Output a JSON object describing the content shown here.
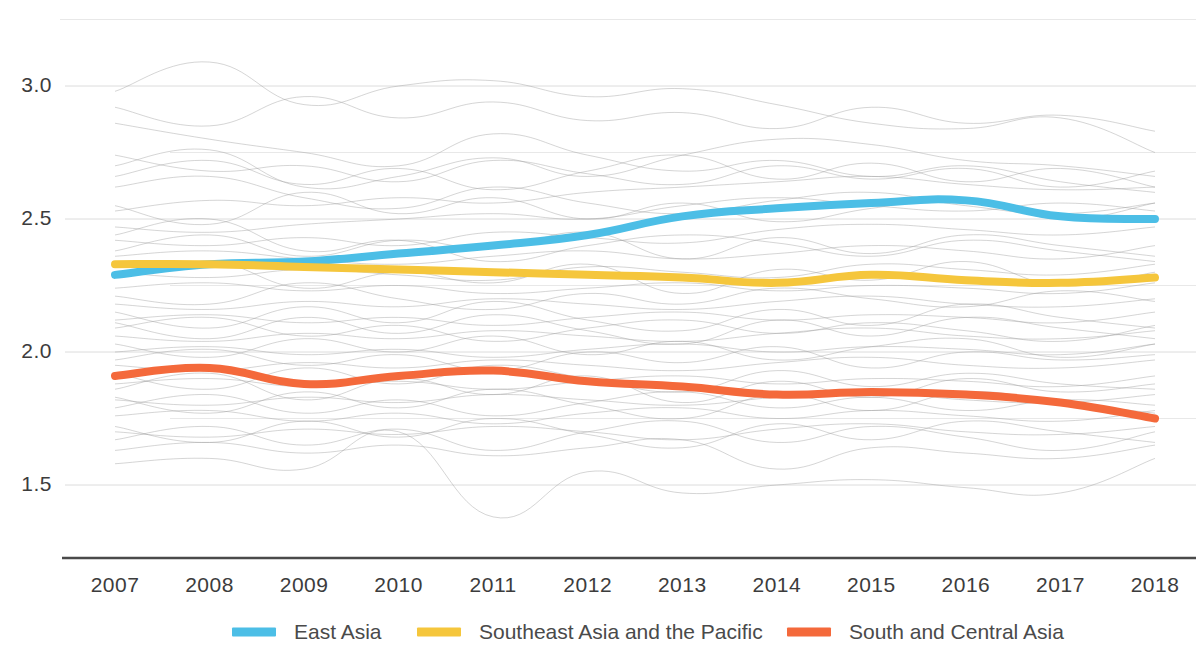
{
  "chart_data": {
    "type": "line",
    "title": "",
    "subtitle": "",
    "xlabel": "",
    "ylabel": "",
    "x": [
      2007,
      2008,
      2009,
      2010,
      2011,
      2012,
      2013,
      2014,
      2015,
      2016,
      2017,
      2018
    ],
    "categories": [
      "2007",
      "2008",
      "2009",
      "2010",
      "2011",
      "2012",
      "2013",
      "2014",
      "2015",
      "2016",
      "2017",
      "2018"
    ],
    "xlim": [
      2007,
      2018
    ],
    "ylim": [
      1.36,
      3.12
    ],
    "yticks": [
      1.5,
      2.0,
      2.5,
      3.0
    ],
    "ytick_labels": [
      "1.5",
      "2.0",
      "2.5",
      "3.0"
    ],
    "yticks_minor": [
      1.75,
      2.25,
      2.75
    ],
    "grid": true,
    "grid_axis": "y",
    "legend_position": "bottom",
    "series": [
      {
        "name": "East Asia",
        "color": "#4CBEE6",
        "highlight": true,
        "values": [
          2.29,
          2.33,
          2.34,
          2.37,
          2.4,
          2.44,
          2.51,
          2.54,
          2.56,
          2.57,
          2.51,
          2.5
        ]
      },
      {
        "name": "Southeast Asia and the Pacific",
        "color": "#F5C63C",
        "highlight": true,
        "values": [
          2.33,
          2.33,
          2.32,
          2.31,
          2.3,
          2.29,
          2.28,
          2.26,
          2.29,
          2.27,
          2.26,
          2.28
        ]
      },
      {
        "name": "South and Central Asia",
        "color": "#F4693B",
        "highlight": true,
        "values": [
          1.91,
          1.94,
          1.88,
          1.91,
          1.93,
          1.89,
          1.87,
          1.84,
          1.85,
          1.84,
          1.81,
          1.75
        ]
      }
    ],
    "background_series_note": "Numerous faint grey country lines shown behind the three highlighted regional averages",
    "background_series": [
      {
        "values": [
          2.98,
          3.09,
          2.93,
          3.0,
          3.02,
          2.96,
          2.99,
          2.93,
          2.86,
          2.84,
          2.88,
          2.75
        ]
      },
      {
        "values": [
          2.7,
          2.76,
          2.62,
          2.66,
          2.73,
          2.66,
          2.74,
          2.8,
          2.78,
          2.72,
          2.7,
          2.66
        ]
      },
      {
        "values": [
          2.53,
          2.57,
          2.55,
          2.58,
          2.56,
          2.6,
          2.62,
          2.64,
          2.66,
          2.63,
          2.61,
          2.62
        ]
      },
      {
        "values": [
          2.47,
          2.45,
          2.48,
          2.5,
          2.52,
          2.5,
          2.55,
          2.58,
          2.55,
          2.53,
          2.56,
          2.53
        ]
      },
      {
        "values": [
          2.42,
          2.4,
          2.43,
          2.4,
          2.45,
          2.43,
          2.41,
          2.46,
          2.48,
          2.46,
          2.44,
          2.47
        ]
      },
      {
        "values": [
          2.36,
          2.38,
          2.35,
          2.33,
          2.36,
          2.38,
          2.35,
          2.37,
          2.4,
          2.38,
          2.35,
          2.4
        ]
      },
      {
        "values": [
          2.3,
          2.28,
          2.31,
          2.29,
          2.27,
          2.32,
          2.3,
          2.28,
          2.33,
          2.31,
          2.29,
          2.33
        ]
      },
      {
        "values": [
          2.24,
          2.26,
          2.23,
          2.25,
          2.22,
          2.24,
          2.26,
          2.23,
          2.25,
          2.24,
          2.22,
          2.26
        ]
      },
      {
        "values": [
          2.18,
          2.16,
          2.19,
          2.17,
          2.2,
          2.18,
          2.16,
          2.19,
          2.21,
          2.18,
          2.17,
          2.2
        ]
      },
      {
        "values": [
          2.12,
          2.14,
          2.11,
          2.13,
          2.1,
          2.13,
          2.15,
          2.12,
          2.14,
          2.13,
          2.11,
          2.15
        ]
      },
      {
        "values": [
          2.06,
          2.04,
          2.07,
          2.05,
          2.08,
          2.06,
          2.04,
          2.07,
          2.09,
          2.06,
          2.05,
          2.08
        ]
      },
      {
        "values": [
          2.0,
          2.02,
          1.99,
          2.01,
          1.98,
          2.01,
          2.03,
          2.0,
          2.02,
          2.01,
          1.99,
          2.03
        ]
      },
      {
        "values": [
          1.95,
          1.93,
          1.96,
          1.94,
          1.97,
          1.95,
          1.93,
          1.96,
          1.98,
          1.95,
          1.94,
          1.97
        ]
      },
      {
        "values": [
          1.88,
          1.9,
          1.87,
          1.89,
          1.86,
          1.89,
          1.91,
          1.88,
          1.9,
          1.89,
          1.87,
          1.91
        ]
      },
      {
        "values": [
          1.82,
          1.8,
          1.83,
          1.81,
          1.84,
          1.82,
          1.8,
          1.83,
          1.85,
          1.82,
          1.81,
          1.84
        ]
      },
      {
        "values": [
          1.76,
          1.78,
          1.74,
          1.77,
          1.73,
          1.77,
          1.79,
          1.75,
          1.78,
          1.76,
          1.74,
          1.78
        ]
      },
      {
        "values": [
          1.7,
          1.68,
          1.71,
          1.69,
          1.72,
          1.7,
          1.67,
          1.71,
          1.73,
          1.7,
          1.69,
          1.72
        ]
      },
      {
        "values": [
          1.63,
          1.66,
          1.62,
          1.65,
          1.61,
          1.64,
          1.67,
          1.56,
          1.64,
          1.62,
          1.6,
          1.65
        ]
      },
      {
        "values": [
          1.58,
          1.6,
          1.56,
          1.7,
          1.38,
          1.55,
          1.47,
          1.5,
          1.52,
          1.49,
          1.47,
          1.6
        ]
      },
      {
        "values": [
          2.86,
          2.8,
          2.75,
          2.7,
          2.82,
          2.74,
          2.68,
          2.72,
          2.66,
          2.7,
          2.64,
          2.6
        ]
      },
      {
        "values": [
          2.62,
          2.66,
          2.58,
          2.54,
          2.62,
          2.56,
          2.52,
          2.57,
          2.6,
          2.55,
          2.52,
          2.56
        ]
      },
      {
        "values": [
          2.44,
          2.5,
          2.38,
          2.42,
          2.34,
          2.4,
          2.44,
          2.41,
          2.36,
          2.42,
          2.38,
          2.34
        ]
      },
      {
        "values": [
          2.21,
          2.18,
          2.26,
          2.2,
          2.16,
          2.22,
          2.18,
          2.24,
          2.2,
          2.17,
          2.23,
          2.19
        ]
      },
      {
        "values": [
          2.09,
          2.13,
          2.06,
          2.1,
          2.04,
          2.09,
          2.12,
          2.07,
          2.11,
          2.08,
          2.04,
          2.1
        ]
      },
      {
        "values": [
          1.92,
          1.86,
          1.94,
          1.88,
          1.95,
          1.9,
          1.85,
          1.93,
          1.87,
          1.92,
          1.88,
          1.86
        ]
      },
      {
        "values": [
          1.79,
          1.84,
          1.77,
          1.82,
          1.76,
          1.81,
          1.85,
          1.79,
          1.83,
          1.78,
          1.82,
          1.8
        ]
      },
      {
        "values": [
          2.55,
          2.48,
          2.6,
          2.52,
          2.58,
          2.5,
          2.56,
          2.49,
          2.54,
          2.58,
          2.5,
          2.56
        ]
      },
      {
        "values": [
          2.28,
          2.34,
          2.24,
          2.3,
          2.26,
          2.33,
          2.22,
          2.31,
          2.27,
          2.34,
          2.25,
          2.3
        ]
      },
      {
        "values": [
          2.15,
          2.09,
          2.17,
          2.11,
          2.19,
          2.12,
          2.08,
          2.16,
          2.1,
          2.18,
          2.13,
          2.09
        ]
      },
      {
        "values": [
          2.03,
          1.98,
          2.05,
          2.0,
          2.06,
          1.99,
          2.04,
          1.97,
          2.02,
          2.05,
          1.98,
          2.03
        ]
      },
      {
        "values": [
          1.86,
          1.92,
          1.82,
          1.9,
          1.84,
          1.91,
          1.81,
          1.89,
          1.83,
          1.9,
          1.85,
          1.88
        ]
      },
      {
        "values": [
          1.72,
          1.66,
          1.74,
          1.68,
          1.75,
          1.69,
          1.64,
          1.73,
          1.67,
          1.74,
          1.7,
          1.66
        ]
      },
      {
        "values": [
          2.92,
          2.85,
          2.96,
          2.88,
          2.94,
          2.87,
          2.9,
          2.84,
          2.92,
          2.86,
          2.89,
          2.83
        ]
      },
      {
        "values": [
          2.74,
          2.68,
          2.7,
          2.64,
          2.72,
          2.67,
          2.63,
          2.7,
          2.65,
          2.69,
          2.62,
          2.68
        ]
      },
      {
        "values": [
          2.38,
          2.44,
          2.36,
          2.42,
          2.39,
          2.45,
          2.35,
          2.43,
          2.37,
          2.44,
          2.4,
          2.36
        ]
      },
      {
        "values": [
          2.11,
          2.05,
          2.13,
          2.07,
          2.14,
          2.08,
          2.03,
          2.12,
          2.06,
          2.13,
          2.09,
          2.05
        ]
      },
      {
        "values": [
          1.97,
          2.01,
          1.95,
          1.99,
          1.93,
          2.0,
          1.96,
          2.02,
          1.94,
          2.0,
          1.97,
          1.99
        ]
      },
      {
        "values": [
          1.83,
          1.77,
          1.85,
          1.79,
          1.86,
          1.8,
          1.75,
          1.84,
          1.78,
          1.85,
          1.81,
          1.77
        ]
      },
      {
        "values": [
          1.67,
          1.72,
          1.65,
          1.71,
          1.63,
          1.7,
          1.74,
          1.66,
          1.72,
          1.68,
          1.63,
          1.7
        ]
      },
      {
        "values": [
          2.66,
          2.72,
          2.63,
          2.69,
          2.61,
          2.68,
          2.74,
          2.65,
          2.71,
          2.64,
          2.69,
          2.62
        ]
      }
    ]
  },
  "axes": {
    "y_tick_labels": [
      "3.0",
      "2.5",
      "2.0",
      "1.5"
    ],
    "x_tick_labels": [
      "2007",
      "2008",
      "2009",
      "2010",
      "2011",
      "2012",
      "2013",
      "2014",
      "2015",
      "2016",
      "2017",
      "2018"
    ]
  },
  "legend": {
    "items": [
      {
        "label": "East Asia",
        "color": "#4CBEE6"
      },
      {
        "label": "Southeast Asia and the Pacific",
        "color": "#F5C63C"
      },
      {
        "label": "South and Central Asia",
        "color": "#F4693B"
      }
    ]
  },
  "colors": {
    "east_asia": "#4CBEE6",
    "southeast_asia": "#F5C63C",
    "south_central_asia": "#F4693B",
    "background_lines": "#9a9a9a",
    "gridline": "#dcdcdc",
    "axis": "#4a4a4a",
    "text": "#3c3c3c"
  }
}
